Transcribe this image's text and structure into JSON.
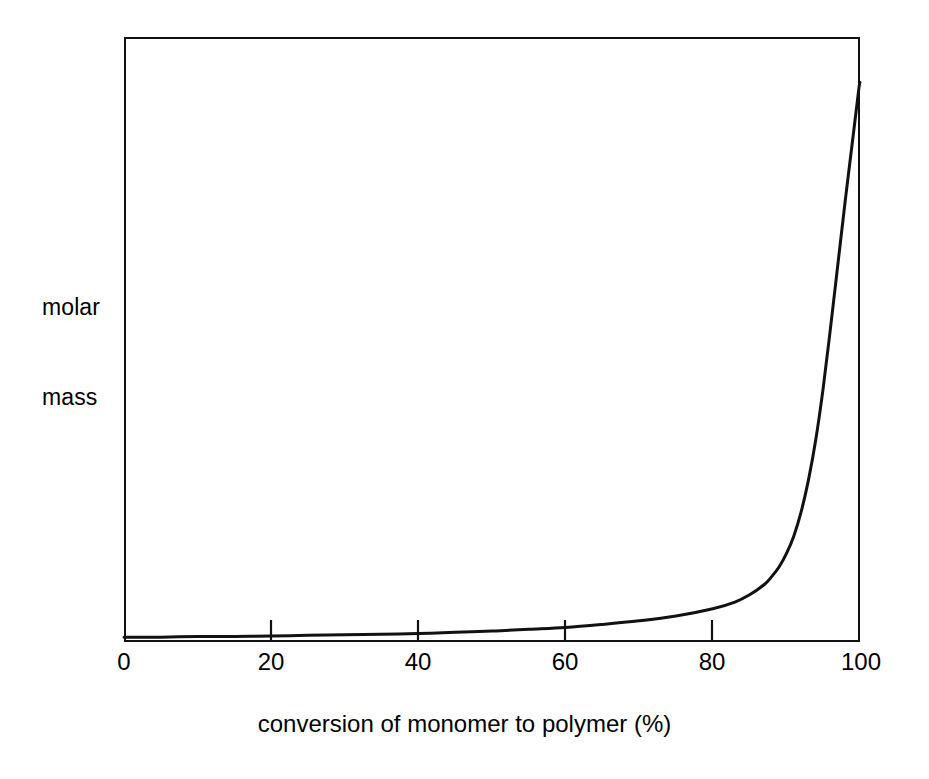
{
  "figure": {
    "width": 929,
    "height": 779,
    "background_color": "#ffffff",
    "ink_color": "#111111"
  },
  "chart_data": {
    "type": "line",
    "title": "",
    "subtitle": "",
    "xlabel": "conversion of monomer to polymer (%)",
    "ylabel": "molar mass",
    "ylabel_lines": [
      "molar",
      "mass"
    ],
    "xlim": [
      0,
      100
    ],
    "ylim": [
      0,
      1
    ],
    "xticks": [
      0,
      20,
      40,
      60,
      80,
      100
    ],
    "xtick_labels": [
      "0",
      "20",
      "40",
      "60",
      "80",
      "100"
    ],
    "yticks": [],
    "ytick_labels": [],
    "grid": false,
    "legend": false,
    "legend_position": "none",
    "annotations": [],
    "series": [
      {
        "name": "molar mass",
        "color": "#111111",
        "line_width": 3,
        "x": [
          0,
          5,
          10,
          15,
          20,
          25,
          30,
          35,
          40,
          45,
          50,
          55,
          60,
          65,
          70,
          75,
          80,
          83,
          85,
          87,
          88,
          89,
          90,
          91,
          92,
          93,
          94,
          95,
          96,
          97,
          98,
          98.6,
          99.2,
          99.6,
          99.9,
          100
        ],
        "y": [
          0.008,
          0.008,
          0.009,
          0.009,
          0.01,
          0.011,
          0.012,
          0.013,
          0.014,
          0.016,
          0.018,
          0.021,
          0.024,
          0.029,
          0.035,
          0.043,
          0.055,
          0.066,
          0.078,
          0.095,
          0.108,
          0.124,
          0.146,
          0.175,
          0.215,
          0.268,
          0.335,
          0.42,
          0.52,
          0.625,
          0.73,
          0.79,
          0.85,
          0.89,
          0.92,
          0.925
        ]
      }
    ]
  },
  "xticks_layout": [
    {
      "value": "0",
      "label": "0",
      "px": 124
    },
    {
      "value": "20",
      "label": "20",
      "px": 271
    },
    {
      "value": "40",
      "label": "40",
      "px": 418
    },
    {
      "value": "60",
      "label": "60",
      "px": 565
    },
    {
      "value": "80",
      "label": "80",
      "px": 712
    },
    {
      "value": "100",
      "label": "100",
      "px": 861
    }
  ]
}
